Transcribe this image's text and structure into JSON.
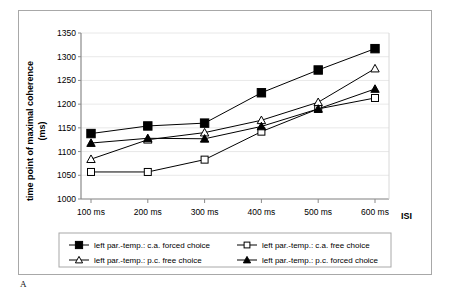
{
  "figure": {
    "panel_letter": "A"
  },
  "chart_data": {
    "type": "line",
    "title": "",
    "xlabel": "ISI",
    "ylabel": "time point of maximal coherence (ms)",
    "ylabel_line1": "time point of maximal coherence",
    "ylabel_line2": "(ms)",
    "categories": [
      "100 ms",
      "200 ms",
      "300 ms",
      "400 ms",
      "500 ms",
      "600 ms"
    ],
    "x_values": [
      100,
      200,
      300,
      400,
      500,
      600
    ],
    "ylim": [
      1000,
      1350
    ],
    "ytick_values": [
      1000,
      1050,
      1100,
      1150,
      1200,
      1250,
      1300,
      1350
    ],
    "ytick_labels": [
      "1000",
      "1050",
      "1100",
      "1150",
      "1200",
      "1250",
      "1300",
      "1350"
    ],
    "grid": "horizontal-light",
    "legend_position": "bottom",
    "series": [
      {
        "name": "left par.-temp.: c.a. forced choice",
        "marker": "filled-square",
        "color": "#000000",
        "values": [
          1138,
          1154,
          1160,
          1224,
          1272,
          1317
        ]
      },
      {
        "name": "left par.-temp.: c.a. free choice",
        "marker": "open-square",
        "color": "#000000",
        "values": [
          1057,
          1057,
          1083,
          1142,
          1190,
          1213
        ]
      },
      {
        "name": "left par.-temp.: p.c. free choice",
        "marker": "open-triangle",
        "color": "#000000",
        "values": [
          1084,
          1125,
          1140,
          1166,
          1204,
          1275
        ]
      },
      {
        "name": "left par.-temp.: p.c. forced choice",
        "marker": "filled-triangle",
        "color": "#000000",
        "values": [
          1118,
          1128,
          1127,
          1153,
          1190,
          1232
        ]
      }
    ]
  },
  "legend": {
    "entries": [
      {
        "label": "left par.-temp.: c.a. forced choice",
        "marker": "filled-square"
      },
      {
        "label": "left par.-temp.: c.a. free choice",
        "marker": "open-square"
      },
      {
        "label": "left par.-temp.: p.c. free choice",
        "marker": "open-triangle"
      },
      {
        "label": "left par.-temp.: p.c. forced choice",
        "marker": "filled-triangle"
      }
    ]
  }
}
